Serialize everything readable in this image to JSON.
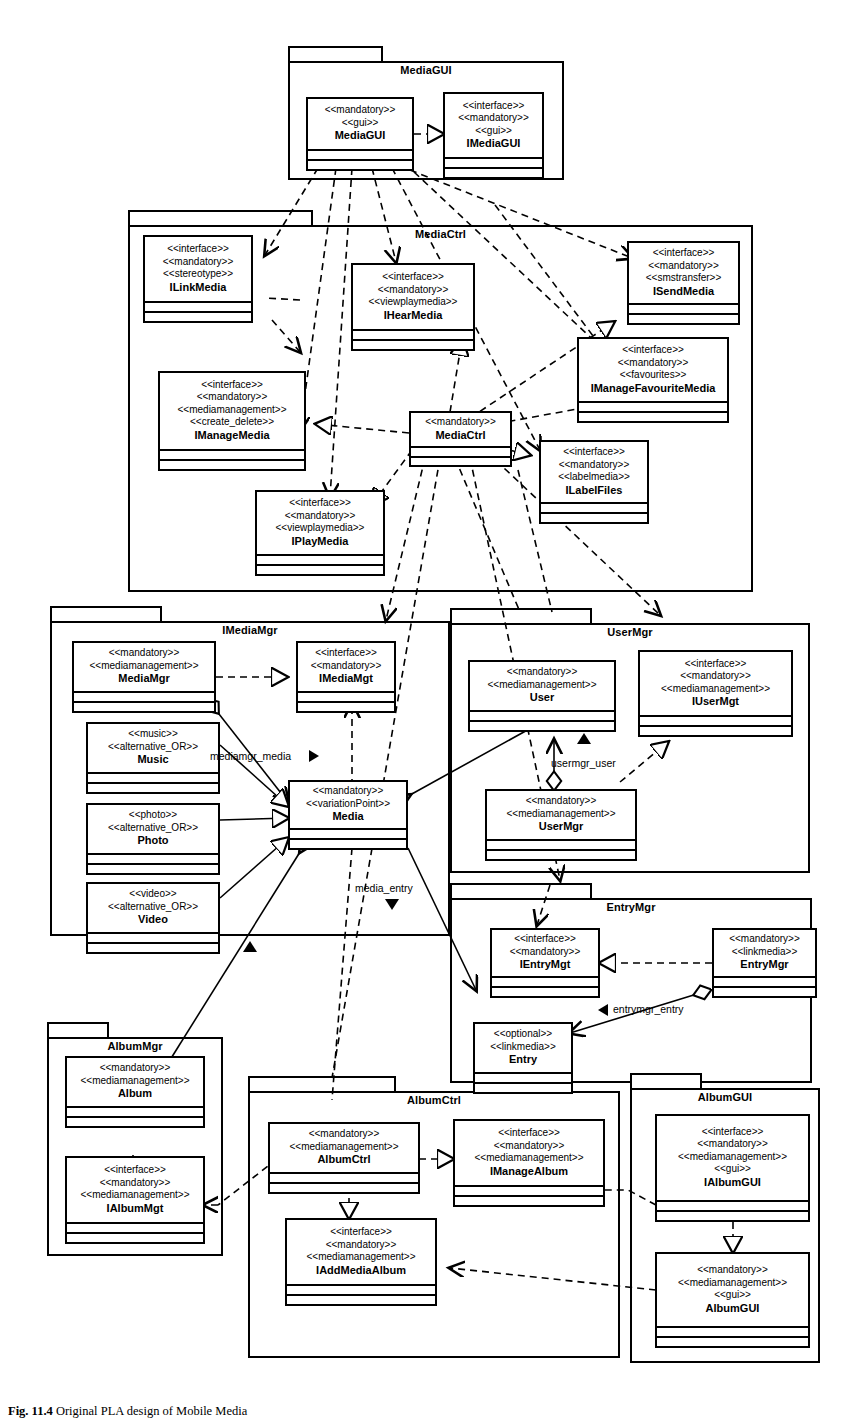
{
  "figure": {
    "label": "Fig. 11.4",
    "caption": "Original PLA design of Mobile Media"
  },
  "packages": [
    {
      "id": "MediaGUI",
      "name": "MediaGUI"
    },
    {
      "id": "MediaCtrl",
      "name": "MediaCtrl"
    },
    {
      "id": "IMediaMgr",
      "name": "IMediaMgr"
    },
    {
      "id": "UserMgr",
      "name": "UserMgr"
    },
    {
      "id": "EntryMgr",
      "name": "EntryMgr"
    },
    {
      "id": "AlbumMgr",
      "name": "AlbumMgr"
    },
    {
      "id": "AlbumCtrl",
      "name": "AlbumCtrl"
    },
    {
      "id": "AlbumGUI",
      "name": "AlbumGUI"
    }
  ],
  "classes": [
    {
      "id": "MediaGUI",
      "package": "MediaGUI",
      "stereotypes": [
        "<<mandatory>>",
        "<<gui>>"
      ],
      "name": "MediaGUI"
    },
    {
      "id": "IMediaGUI",
      "package": "MediaGUI",
      "stereotypes": [
        "<<interface>>",
        "<<mandatory>>",
        "<<gui>>"
      ],
      "name": "IMediaGUI"
    },
    {
      "id": "ILinkMedia",
      "package": "MediaCtrl",
      "stereotypes": [
        "<<interface>>",
        "<<mandatory>>",
        "<<stereotype>>"
      ],
      "name": "ILinkMedia"
    },
    {
      "id": "IHearMedia",
      "package": "MediaCtrl",
      "stereotypes": [
        "<<interface>>",
        "<<mandatory>>",
        "<<viewplaymedia>>"
      ],
      "name": "IHearMedia"
    },
    {
      "id": "ISendMedia",
      "package": "MediaCtrl",
      "stereotypes": [
        "<<interface>>",
        "<<mandatory>>",
        "<<smstransfer>>"
      ],
      "name": "ISendMedia"
    },
    {
      "id": "IManageFavouriteMedia",
      "package": "MediaCtrl",
      "stereotypes": [
        "<<interface>>",
        "<<mandatory>>",
        "<<favourites>>"
      ],
      "name": "IManageFavouriteMedia"
    },
    {
      "id": "IManageMedia",
      "package": "MediaCtrl",
      "stereotypes": [
        "<<interface>>",
        "<<mandatory>>",
        "<<mediamanagement>>",
        "<<create_delete>>"
      ],
      "name": "IManageMedia"
    },
    {
      "id": "MediaCtrl",
      "package": "MediaCtrl",
      "stereotypes": [
        "<<mandatory>>"
      ],
      "name": "MediaCtrl"
    },
    {
      "id": "ILabelFiles",
      "package": "MediaCtrl",
      "stereotypes": [
        "<<interface>>",
        "<<mandatory>>",
        "<<labelmedia>>"
      ],
      "name": "ILabelFiles"
    },
    {
      "id": "IPlayMedia",
      "package": "MediaCtrl",
      "stereotypes": [
        "<<interface>>",
        "<<mandatory>>",
        "<<viewplaymedia>>"
      ],
      "name": "IPlayMedia"
    },
    {
      "id": "MediaMgr",
      "package": "IMediaMgr",
      "stereotypes": [
        "<<mandatory>>",
        "<<mediamanagement>>"
      ],
      "name": "MediaMgr"
    },
    {
      "id": "IMediaMgt",
      "package": "IMediaMgr",
      "stereotypes": [
        "<<interface>>",
        "<<mandatory>>"
      ],
      "name": "IMediaMgt"
    },
    {
      "id": "Music",
      "package": "IMediaMgr",
      "stereotypes": [
        "<<music>>",
        "<<alternative_OR>>"
      ],
      "name": "Music"
    },
    {
      "id": "Photo",
      "package": "IMediaMgr",
      "stereotypes": [
        "<<photo>>",
        "<<alternative_OR>>"
      ],
      "name": "Photo"
    },
    {
      "id": "Video",
      "package": "IMediaMgr",
      "stereotypes": [
        "<<video>>",
        "<<alternative_OR>>"
      ],
      "name": "Video"
    },
    {
      "id": "Media",
      "package": "IMediaMgr",
      "stereotypes": [
        "<<mandatory>>",
        "<<variationPoint>>"
      ],
      "name": "Media"
    },
    {
      "id": "User",
      "package": "UserMgr",
      "stereotypes": [
        "<<mandatory>>",
        "<<mediamanagement>>"
      ],
      "name": "User"
    },
    {
      "id": "IUserMgt",
      "package": "UserMgr",
      "stereotypes": [
        "<<interface>>",
        "<<mandatory>>",
        "<<mediamanagement>>"
      ],
      "name": "IUserMgt"
    },
    {
      "id": "UserMgr",
      "package": "UserMgr",
      "stereotypes": [
        "<<mandatory>>",
        "<<mediamanagement>>"
      ],
      "name": "UserMgr"
    },
    {
      "id": "IEntryMgt",
      "package": "EntryMgr",
      "stereotypes": [
        "<<interface>>",
        "<<mandatory>>"
      ],
      "name": "IEntryMgt"
    },
    {
      "id": "EntryMgr",
      "package": "EntryMgr",
      "stereotypes": [
        "<<mandatory>>",
        "<<linkmedia>>"
      ],
      "name": "EntryMgr"
    },
    {
      "id": "Entry",
      "package": "EntryMgr",
      "stereotypes": [
        "<<optional>>",
        "<<linkmedia>>"
      ],
      "name": "Entry"
    },
    {
      "id": "Album",
      "package": "AlbumMgr",
      "stereotypes": [
        "<<mandatory>>",
        "<<mediamanagement>>"
      ],
      "name": "Album"
    },
    {
      "id": "IAlbumMgt",
      "package": "AlbumMgr",
      "stereotypes": [
        "<<interface>>",
        "<<mandatory>>",
        "<<mediamanagement>>"
      ],
      "name": "IAlbumMgt"
    },
    {
      "id": "AlbumCtrl",
      "package": "AlbumCtrl",
      "stereotypes": [
        "<<mandatory>>",
        "<<mediamanagement>>"
      ],
      "name": "AlbumCtrl"
    },
    {
      "id": "IManageAlbum",
      "package": "AlbumCtrl",
      "stereotypes": [
        "<<interface>>",
        "<<mandatory>>",
        "<<mediamanagement>>"
      ],
      "name": "IManageAlbum"
    },
    {
      "id": "IAddMediaAlbum",
      "package": "AlbumCtrl",
      "stereotypes": [
        "<<interface>>",
        "<<mandatory>>",
        "<<mediamanagement>>"
      ],
      "name": "IAddMediaAlbum"
    },
    {
      "id": "IAlbumGUI",
      "package": "AlbumGUI",
      "stereotypes": [
        "<<interface>>",
        "<<mandatory>>",
        "<<mediamanagement>>",
        "<<gui>>"
      ],
      "name": "IAlbumGUI"
    },
    {
      "id": "AlbumGUI",
      "package": "AlbumGUI",
      "stereotypes": [
        "<<mandatory>>",
        "<<mediamanagement>>",
        "<<gui>>"
      ],
      "name": "AlbumGUI"
    }
  ],
  "edge_labels": [
    {
      "id": "mediamgr_media",
      "text": "mediamgr_media"
    },
    {
      "id": "usermgr_user",
      "text": "usermgr_user"
    },
    {
      "id": "media_entry",
      "text": "media_entry"
    },
    {
      "id": "entrymgr_entry",
      "text": "entrymgr_entry"
    }
  ],
  "colors": {
    "line": "#000000",
    "background": "#ffffff"
  }
}
